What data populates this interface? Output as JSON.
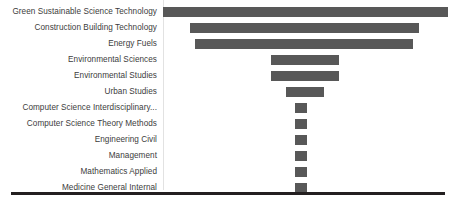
{
  "chart_data": {
    "type": "bar",
    "orientation": "horizontal",
    "layout": "centered-funnel",
    "title": "",
    "subtitle": "",
    "xlabel": "",
    "ylabel": "",
    "legend": [],
    "grid": false,
    "bar_color": "#585858",
    "axis_line_color": "#e2e2e2",
    "baseline_color": "#231f20",
    "background_color": "#ffffff",
    "categories": [
      "Green Sustainable Science Technology",
      "Construction Building Technology",
      "Energy Fuels",
      "Environmental Sciences",
      "Environmental Studies",
      "Urban Studies",
      "Computer Science Interdisciplinary...",
      "Computer Science Theory Methods",
      "Engineering Civil",
      "Management",
      "Mathematics Applied",
      "Medicine General Internal"
    ],
    "values": [
      285,
      229,
      218,
      68,
      68,
      38,
      12,
      12,
      12,
      12,
      12,
      12
    ],
    "value_unit": "px-width",
    "xlim": [
      0,
      285
    ],
    "center_x": 305,
    "bars": [
      {
        "label": "Green Sustainable Science Technology",
        "value": 285,
        "left": 163,
        "width": 285
      },
      {
        "label": "Construction Building Technology",
        "value": 229,
        "left": 190,
        "width": 229
      },
      {
        "label": "Energy Fuels",
        "value": 218,
        "left": 195,
        "width": 218
      },
      {
        "label": "Environmental Sciences",
        "value": 68,
        "left": 271,
        "width": 68
      },
      {
        "label": "Environmental Studies",
        "value": 68,
        "left": 271,
        "width": 68
      },
      {
        "label": "Urban Studies",
        "value": 38,
        "left": 286,
        "width": 38
      },
      {
        "label": "Computer Science Interdisciplinary...",
        "value": 12,
        "left": 295,
        "width": 12
      },
      {
        "label": "Computer Science Theory Methods",
        "value": 12,
        "left": 295,
        "width": 12
      },
      {
        "label": "Engineering Civil",
        "value": 12,
        "left": 295,
        "width": 12
      },
      {
        "label": "Management",
        "value": 12,
        "left": 295,
        "width": 12
      },
      {
        "label": "Mathematics Applied",
        "value": 12,
        "left": 295,
        "width": 12
      },
      {
        "label": "Medicine General Internal",
        "value": 12,
        "left": 295,
        "width": 12
      }
    ]
  }
}
